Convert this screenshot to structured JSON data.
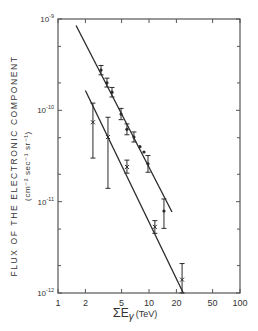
{
  "chart_data": {
    "type": "scatter",
    "title": "",
    "xlabel": "ΣEγ (TeV)",
    "xlabel_parts": {
      "sigma": "Σ",
      "e": "E",
      "gamma": "γ",
      "unit": "(TeV)"
    },
    "ylabel": "FLUX OF THE ELECTRONIC COMPONENT",
    "ylabel_units": "(cm⁻² sec⁻¹ sr⁻¹)",
    "xscale": "log",
    "yscale": "log",
    "xlim": [
      1,
      100
    ],
    "ylim": [
      1e-12,
      1e-09
    ],
    "x_ticks": [
      {
        "value": 1,
        "label": "1"
      },
      {
        "value": 2,
        "label": "2"
      },
      {
        "value": 5,
        "label": "5"
      },
      {
        "value": 10,
        "label": "10"
      },
      {
        "value": 20,
        "label": "20"
      },
      {
        "value": 50,
        "label": "50"
      },
      {
        "value": 100,
        "label": "100"
      }
    ],
    "y_ticks": [
      {
        "value": 1e-09,
        "label_base": "10",
        "label_exp": "-9"
      },
      {
        "value": 1e-10,
        "label_base": "10",
        "label_exp": "-10"
      },
      {
        "value": 1e-11,
        "label_base": "10",
        "label_exp": "-11"
      },
      {
        "value": 1e-12,
        "label_base": "10",
        "label_exp": "-12"
      }
    ],
    "grid": false,
    "series": [
      {
        "name": "upper",
        "marker": "cross-with-errorbar",
        "points": [
          {
            "x": 2.97,
            "y": 2.76e-10,
            "ylo": 2.45e-10,
            "yhi": 3.1e-10
          },
          {
            "x": 3.45,
            "y": 2e-10,
            "ylo": 1.8e-10,
            "yhi": 2.25e-10
          },
          {
            "x": 3.92,
            "y": 1.58e-10,
            "ylo": 1.4e-10,
            "yhi": 1.78e-10
          },
          {
            "x": 4.93,
            "y": 9.1e-11,
            "ylo": 7.9e-11,
            "yhi": 1.05e-10
          },
          {
            "x": 5.72,
            "y": 6.2e-11,
            "ylo": 5.4e-11,
            "yhi": 7.1e-11
          },
          {
            "x": 6.83,
            "y": 5.1e-11,
            "ylo": 4.5e-11,
            "yhi": 5.8e-11
          },
          {
            "x": 7.95,
            "y": 4e-11,
            "ylo": 4e-11,
            "yhi": 4e-11
          },
          {
            "x": 8.81,
            "y": 3.5e-11,
            "ylo": 3.5e-11,
            "yhi": 3.5e-11
          },
          {
            "x": 9.75,
            "y": 2.6e-11,
            "ylo": 2.1e-11,
            "yhi": 3.2e-11
          },
          {
            "x": 14.6,
            "y": 7.9e-12,
            "ylo": 5.1e-12,
            "yhi": 1.07e-11
          }
        ],
        "fit_line": {
          "x0": 1.58,
          "y0": 8.5e-10,
          "x1": 17.9,
          "y1": 7.7e-12
        }
      },
      {
        "name": "lower",
        "marker": "x-with-errorbar",
        "points": [
          {
            "x": 2.42,
            "y": 7.4e-11,
            "ylo": 3e-11,
            "yhi": 1.2e-10
          },
          {
            "x": 3.54,
            "y": 5.1e-11,
            "ylo": 1.4e-11,
            "yhi": 8.4e-11
          },
          {
            "x": 5.72,
            "y": 2.4e-11,
            "ylo": 2.05e-11,
            "yhi": 2.85e-11
          },
          {
            "x": 11.6,
            "y": 5.3e-12,
            "ylo": 4.5e-12,
            "yhi": 6.2e-12
          },
          {
            "x": 23.1,
            "y": 1.4e-12,
            "ylo": 1e-12,
            "yhi": 2.1e-12
          }
        ],
        "fit_line": {
          "x0": 2.0,
          "y0": 1.65e-10,
          "x1": 23.8,
          "y1": 1e-12
        }
      }
    ]
  }
}
